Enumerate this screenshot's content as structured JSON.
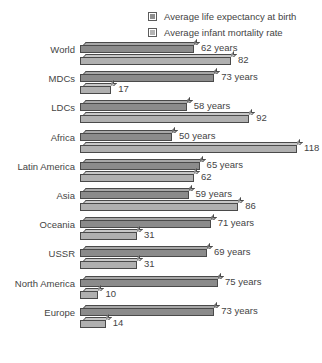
{
  "legend": {
    "items": [
      {
        "label": "Average life expectancy at birth",
        "swatch": "legend-swatch-life-expectancy",
        "color": "#8f8f8f"
      },
      {
        "label": "Average infant mortality rate",
        "swatch": "legend-swatch-infant-mortality",
        "color": "#b4b4b4"
      }
    ]
  },
  "chart_data": {
    "type": "bar",
    "orientation": "horizontal",
    "title": "",
    "subtitle": "",
    "xlabel": "",
    "ylabel": "",
    "grid": false,
    "legend_position": "top-right",
    "xlim": [
      0,
      130
    ],
    "categories": [
      "World",
      "MDCs",
      "LDCs",
      "Africa",
      "Latin America",
      "Asia",
      "Oceania",
      "USSR",
      "North America",
      "Europe"
    ],
    "series": [
      {
        "name": "Average life expectancy at birth",
        "color": "#8b8b8b",
        "values": [
          62,
          73,
          58,
          50,
          65,
          59,
          71,
          69,
          75,
          73
        ],
        "value_labels": [
          "62 years",
          "73 years",
          "58 years",
          "50 years",
          "65 years",
          "59 years",
          "71 years",
          "69 years",
          "75 years",
          "73 years"
        ]
      },
      {
        "name": "Average infant mortality rate",
        "color": "#b0b0b0",
        "values": [
          82,
          17,
          92,
          118,
          62,
          86,
          31,
          31,
          10,
          14
        ],
        "value_labels": [
          "82",
          "17",
          "92",
          "118",
          "62",
          "86",
          "31",
          "31",
          "10",
          "14"
        ]
      }
    ]
  }
}
